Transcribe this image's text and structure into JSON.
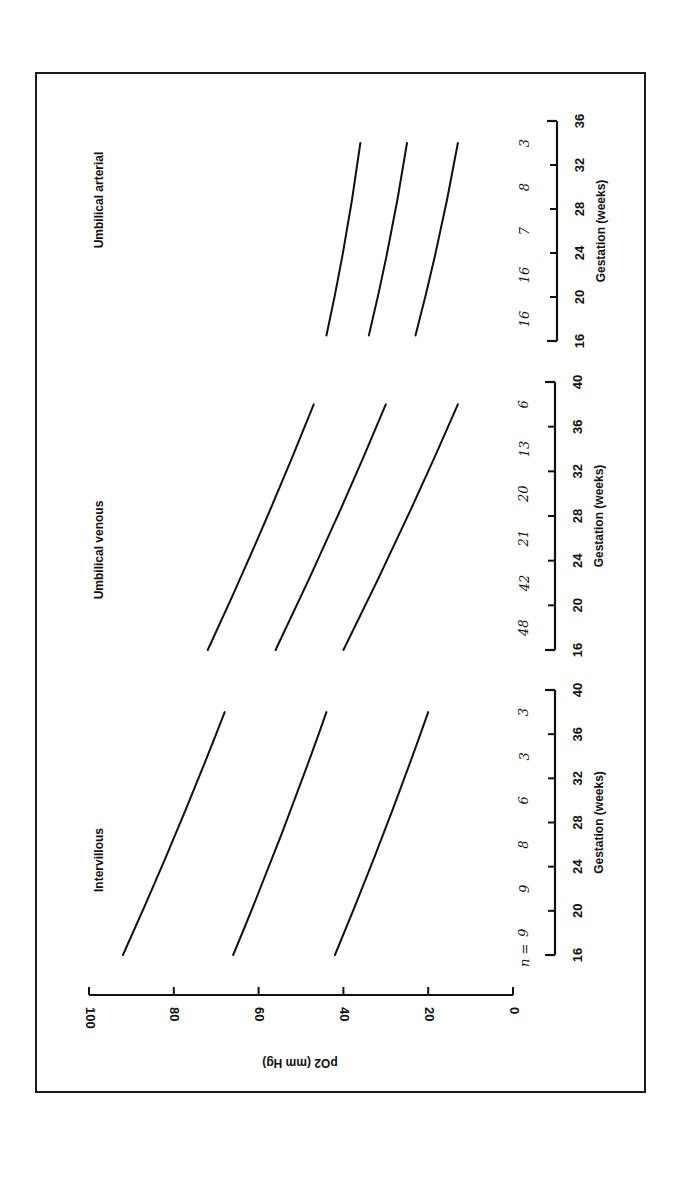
{
  "chart_data": {
    "type": "line",
    "orientation": "figure rotated 90 degrees counter-clockwise",
    "ylabel": "pO2 (mm Hg)",
    "ylim": [
      0,
      100
    ],
    "yticks": [
      0,
      20,
      40,
      60,
      80,
      100
    ],
    "n_prefix": "n =",
    "panels": [
      {
        "title": "Intervillous",
        "xlabel": "Gestation (weeks)",
        "xlim": [
          16,
          40
        ],
        "xticks": [
          16,
          20,
          24,
          28,
          32,
          36,
          40
        ],
        "n_counts": [
          "9",
          "9",
          "8",
          "6",
          "3",
          "3"
        ],
        "series": [
          {
            "name": "upper",
            "x": [
              16,
              38
            ],
            "y": [
              92,
              68
            ]
          },
          {
            "name": "mean",
            "x": [
              16,
              38
            ],
            "y": [
              66,
              44
            ]
          },
          {
            "name": "lower",
            "x": [
              16,
              38
            ],
            "y": [
              42,
              20
            ]
          }
        ]
      },
      {
        "title": "Umbilical venous",
        "xlabel": "Gestation (weeks)",
        "xlim": [
          16,
          40
        ],
        "xticks": [
          16,
          20,
          24,
          28,
          32,
          36,
          40
        ],
        "n_counts": [
          "48",
          "42",
          "21",
          "20",
          "13",
          "6"
        ],
        "series": [
          {
            "name": "upper",
            "x": [
              16,
              38
            ],
            "y": [
              72,
              47
            ]
          },
          {
            "name": "mean",
            "x": [
              16,
              38
            ],
            "y": [
              56,
              30
            ]
          },
          {
            "name": "lower",
            "x": [
              16,
              38
            ],
            "y": [
              40,
              13
            ]
          }
        ]
      },
      {
        "title": "Umbilical arterial",
        "xlabel": "Gestation (weeks)",
        "xlim": [
          16,
          36
        ],
        "xticks": [
          16,
          20,
          24,
          28,
          32,
          36
        ],
        "n_counts": [
          "16",
          "16",
          "7",
          "8",
          "3"
        ],
        "series": [
          {
            "name": "upper",
            "x": [
              16.5,
              34
            ],
            "y": [
              44,
              36
            ]
          },
          {
            "name": "mean",
            "x": [
              16.5,
              34
            ],
            "y": [
              34,
              25
            ]
          },
          {
            "name": "lower",
            "x": [
              16.5,
              34
            ],
            "y": [
              23,
              13
            ]
          }
        ]
      }
    ],
    "grid": false,
    "legend": "none"
  },
  "colors": {
    "ink": "#111111",
    "background": "#ffffff"
  }
}
